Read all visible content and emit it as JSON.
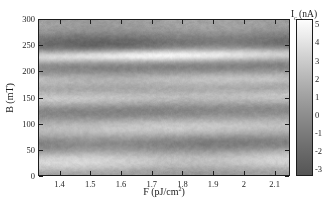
{
  "figure": {
    "type": "heatmap-figure",
    "background_color": "#ffffff"
  },
  "axes": {
    "x": {
      "title_main": "F (pJ/cm",
      "title_sup": "2",
      "title_close": ")",
      "title_full": "F (pJ/cm2)",
      "ticks": [
        "1.4",
        "1.5",
        "1.6",
        "1.7",
        "1.8",
        "1.9",
        "2",
        "2.1"
      ],
      "tick_values": [
        1.4,
        1.5,
        1.6,
        1.7,
        1.8,
        1.9,
        2.0,
        2.1
      ],
      "range": [
        1.33,
        2.15
      ]
    },
    "y": {
      "title_full": "B (mT)",
      "ticks": [
        "0",
        "50",
        "100",
        "150",
        "200",
        "250",
        "300"
      ],
      "tick_values": [
        0,
        50,
        100,
        150,
        200,
        250,
        300
      ],
      "range": [
        0,
        300
      ]
    }
  },
  "colorbar": {
    "title_main": "I",
    "title_sub": "c",
    "title_unit": " (nA)",
    "title_full": "Ic (nA)",
    "ticks": [
      "5",
      "4",
      "3",
      "2",
      "1",
      "0",
      "-1",
      "-2",
      "-3"
    ],
    "tick_values": [
      5,
      4,
      3,
      2,
      1,
      0,
      -1,
      -2,
      -3
    ],
    "range": [
      -3.4,
      5.3
    ],
    "colormap": "gray",
    "low_color": "#555555",
    "high_color": "#fdfdfd"
  },
  "chart_data": {
    "type": "heatmap",
    "title": "",
    "xlabel": "F (pJ/cm2)",
    "ylabel": "B (mT)",
    "zlabel": "Ic (nA)",
    "xlim": [
      1.33,
      2.15
    ],
    "ylim": [
      0,
      300
    ],
    "zlim": [
      -3.4,
      5.3
    ],
    "grid": false,
    "colormap": "gray",
    "legend_position": "right-colorbar",
    "x_ticks": [
      1.4,
      1.5,
      1.6,
      1.7,
      1.8,
      1.9,
      2.0,
      2.1
    ],
    "y_ticks": [
      0,
      50,
      100,
      150,
      200,
      250,
      300
    ],
    "z_ticks": [
      -3,
      -2,
      -1,
      0,
      1,
      2,
      3,
      4,
      5
    ],
    "bands": [
      {
        "B_center": 255,
        "width": 22,
        "Ic": -2.3,
        "kind": "dark"
      },
      {
        "B_center": 232,
        "width": 12,
        "Ic": 4.6,
        "kind": "bright"
      },
      {
        "B_center": 206,
        "width": 16,
        "Ic": -1.6,
        "kind": "dark"
      },
      {
        "B_center": 185,
        "width": 18,
        "Ic": 2.0,
        "kind": "bright"
      },
      {
        "B_center": 168,
        "width": 12,
        "Ic": -0.6,
        "kind": "dark"
      },
      {
        "B_center": 149,
        "width": 16,
        "Ic": 2.2,
        "kind": "bright"
      },
      {
        "B_center": 122,
        "width": 20,
        "Ic": -1.4,
        "kind": "dark"
      },
      {
        "B_center": 92,
        "width": 20,
        "Ic": 2.3,
        "kind": "bright"
      },
      {
        "B_center": 60,
        "width": 18,
        "Ic": -1.5,
        "kind": "dark"
      },
      {
        "B_center": 26,
        "width": 20,
        "Ic": 2.6,
        "kind": "bright"
      },
      {
        "B_center": 5,
        "width": 10,
        "Ic": -0.4,
        "kind": "dark"
      },
      {
        "B_center": 288,
        "width": 16,
        "Ic": 0.4,
        "kind": "bright"
      }
    ],
    "baseline_Ic": 0.2,
    "noise_amplitude": 0.35
  }
}
